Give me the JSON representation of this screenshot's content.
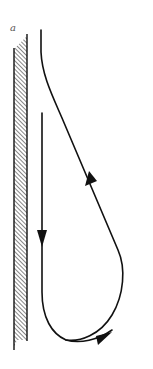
{
  "figure": {
    "panel_label": "a",
    "colors": {
      "ink": "#111111",
      "label": "#555555",
      "background": "#ffffff"
    },
    "arrows": [
      {
        "name": "arrow-downward",
        "direction": "down"
      },
      {
        "name": "arrow-rightward",
        "direction": "right"
      },
      {
        "name": "arrow-upward",
        "direction": "up-left"
      }
    ]
  }
}
